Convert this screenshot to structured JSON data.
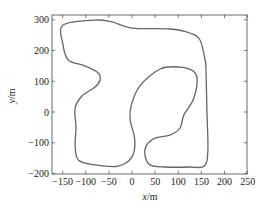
{
  "chart_data": {
    "type": "line",
    "title": "",
    "xlabel": "x/m",
    "ylabel": "y/m",
    "xlim": [
      -172,
      250
    ],
    "ylim": [
      -200,
      315
    ],
    "grid": false,
    "legend": null,
    "xticks": [
      -150,
      -100,
      -50,
      0,
      50,
      100,
      150,
      200,
      250
    ],
    "yticks": [
      -200,
      -100,
      0,
      100,
      200,
      300
    ],
    "series": [
      {
        "name": "track",
        "closed": true,
        "color": "#666666",
        "x": [
          -149,
          -80,
          -43,
          0,
          82,
          125,
          147,
          158,
          160,
          162,
          164,
          156,
          125,
          71,
          39,
          28,
          32,
          50,
          82,
          104,
          112,
          132,
          141,
          132,
          104,
          61,
          17,
          -2,
          -4,
          6,
          0,
          -30,
          -80,
          -116,
          -123,
          -121,
          -123,
          -108,
          -80,
          -69,
          -73,
          -102,
          -138,
          -149
        ],
        "y": [
          283,
          299,
          293,
          273,
          270,
          257,
          234,
          169,
          137,
          7,
          -124,
          -176,
          -179,
          -179,
          -172,
          -140,
          -107,
          -85,
          -75,
          -52,
          -10,
          39,
          104,
          133,
          146,
          140,
          85,
          20,
          -26,
          -91,
          -146,
          -176,
          -172,
          -156,
          -107,
          -52,
          13,
          52,
          81,
          104,
          127,
          150,
          169,
          218
        ]
      }
    ]
  },
  "axes": {
    "x_tick_labels": [
      "−150",
      "−100",
      "−50",
      "0",
      "50",
      "100",
      "150",
      "200",
      "250"
    ],
    "y_tick_labels": [
      "300",
      "200",
      "100",
      "0",
      "−100",
      "−200"
    ],
    "x_label_var": "x",
    "x_label_unit": "/m",
    "y_label_var": "y",
    "y_label_unit": "/m"
  }
}
